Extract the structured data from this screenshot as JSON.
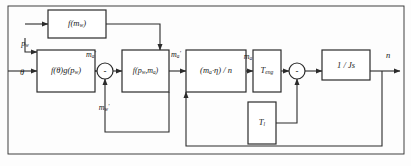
{
  "diagram": {
    "stroke_color": "#2b2b2b",
    "text_color": "#1a1a1a",
    "background": "#fdfdfd",
    "frame": {
      "label": "outer-frame",
      "x": 8,
      "y": 6,
      "width": 396,
      "height": 148
    },
    "blocks": [
      {
        "name": "block-f-mw",
        "label_html": "f(m<span class=\"sub\">w</span>)",
        "x": 48,
        "y": 10,
        "width": 58,
        "height": 28,
        "font_size": 8.5
      },
      {
        "name": "block-f-theta-g-pw",
        "label_html": "f(&#952;)g(p<span class=\"sub\">w</span>)",
        "x": 37,
        "y": 50,
        "width": 58,
        "height": 42,
        "font_size": 8.5
      },
      {
        "name": "block-f-pw-ma",
        "label_html": "f(p<span class=\"sub\">w</span>,m<span class=\"sub\">a</span>)",
        "x": 122,
        "y": 50,
        "width": 47,
        "height": 42,
        "font_size": 8.0
      },
      {
        "name": "block-ma-eta-n",
        "label_html": "(m<span class=\"sub\">a</span>&#183;&#951;) / n",
        "x": 186,
        "y": 50,
        "width": 60,
        "height": 42,
        "font_size": 8.5
      },
      {
        "name": "block-t-eng",
        "label_html": "T<span class=\"sub\">eng</span>",
        "x": 253,
        "y": 50,
        "width": 28,
        "height": 42,
        "font_size": 8.5
      },
      {
        "name": "block-t-load",
        "label_html": "T<span class=\"sub\">l</span>",
        "x": 248,
        "y": 102,
        "width": 28,
        "height": 42,
        "font_size": 8.5
      },
      {
        "name": "block-one-over-js",
        "label_html": "1 / Js",
        "x": 322,
        "y": 50,
        "width": 48,
        "height": 30,
        "font_size": 8.5
      }
    ],
    "summing_junctions": [
      {
        "name": "sum-junction-air",
        "cx": 105,
        "cy": 71,
        "r": 8,
        "sign": "-"
      },
      {
        "name": "sum-junction-torque",
        "cx": 297,
        "cy": 71,
        "r": 8,
        "sign": "-"
      }
    ],
    "signals": [
      {
        "name": "signal-pw-input",
        "label_html": "p<span class=\"sub\">w</span>",
        "x": 25,
        "y": 44,
        "font_size": 8.0
      },
      {
        "name": "signal-theta-input",
        "label_html": "&#952;",
        "x": 22,
        "y": 72,
        "font_size": 8.5
      },
      {
        "name": "signal-ma-prime-1",
        "label_html": "m<span class=\"sub\">a</span><span class=\"prime\">&#8242;</span>",
        "x": 91,
        "y": 55,
        "font_size": 8.0
      },
      {
        "name": "signal-mw-prime",
        "label_html": "m<span class=\"sub\">w</span><span class=\"prime\">&#8242;</span>",
        "x": 104,
        "y": 108,
        "font_size": 8.0
      },
      {
        "name": "signal-ma-prime-2",
        "label_html": "m<span class=\"sub\">a</span><span class=\"prime\">&#8242;</span>",
        "x": 176,
        "y": 55,
        "font_size": 8.0
      },
      {
        "name": "signal-ma",
        "label_html": "m<span class=\"sub\">a</span>",
        "x": 248,
        "y": 57,
        "font_size": 8.0
      },
      {
        "name": "signal-n-output",
        "label_html": "n",
        "x": 388,
        "y": 55,
        "font_size": 8.5
      }
    ],
    "connections": [
      {
        "name": "wire-theta-to-f-theta",
        "points": "8,71 37,71",
        "arrow_at_end": true
      },
      {
        "name": "wire-pw-branch-down",
        "points": "25,38 25,52 37,52",
        "arrow_at_end": true
      },
      {
        "name": "wire-f-theta-to-sum",
        "points": "95,71 97,71",
        "arrow_at_end": true
      },
      {
        "name": "wire-sum-to-f-pw-ma",
        "points": "113,71 122,71",
        "arrow_at_end": true
      },
      {
        "name": "wire-f-pw-ma-to-ma-eta",
        "points": "169,71 186,71",
        "arrow_at_end": true
      },
      {
        "name": "wire-ma-eta-to-teng",
        "points": "246,71 253,71",
        "arrow_at_end": true
      },
      {
        "name": "wire-teng-to-sum2",
        "points": "281,71 289,71",
        "arrow_at_end": true
      },
      {
        "name": "wire-sum2-to-js",
        "points": "305,71 322,71",
        "arrow_at_end": true
      },
      {
        "name": "wire-js-to-output",
        "points": "370,71 400,71",
        "arrow_at_end": true
      },
      {
        "name": "wire-mw-feedback-top",
        "points": "169,92 169,132 105,132 105,79",
        "arrow_at_end": true
      },
      {
        "name": "wire-f-mw-input-left",
        "points": "25,24 48,24",
        "arrow_at_end": true
      },
      {
        "name": "wire-f-mw-output",
        "points": "106,24 160,24 160,50",
        "arrow_at_end": true
      },
      {
        "name": "wire-n-to-tload",
        "points": "382,71 382,146 186,146 186,92",
        "arrow_at_end": true
      },
      {
        "name": "wire-tload-out",
        "points": "276,123 297,123 297,79",
        "arrow_at_end": true
      }
    ]
  }
}
